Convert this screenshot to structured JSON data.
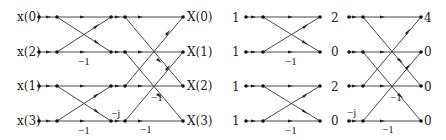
{
  "left_diagram": {
    "title": "4-point radix-2 DIT FFT butterfly flow graph",
    "inputs": [
      "x(0)",
      "x(2)",
      "x(1)",
      "x(3)"
    ],
    "outputs": [
      "X(0)",
      "X(1)",
      "X(2)",
      "X(3)"
    ],
    "gains": {
      "stage1_row2": "−1",
      "stage1_row4": "−1",
      "twiddle_row4": "−j",
      "stage2_row3": "−1",
      "stage2_row4": "−1"
    }
  },
  "right_diagram": {
    "title": "Numeric example of 4-point FFT",
    "inputs": [
      "1",
      "1",
      "1",
      "1"
    ],
    "intermediate": [
      "2",
      "0",
      "2",
      "0"
    ],
    "outputs": [
      "4",
      "0",
      "0",
      "0"
    ],
    "gains": {
      "stage1_row2": "−1",
      "stage1_row4": "−1",
      "twiddle_row4": "−j",
      "stage2_row3": "−1",
      "stage2_row4": "−1"
    }
  }
}
